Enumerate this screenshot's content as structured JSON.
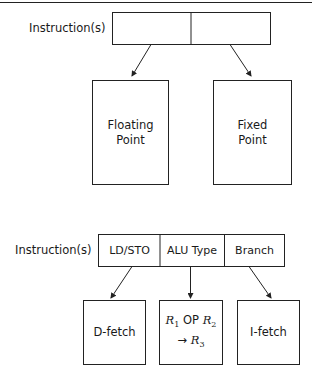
{
  "diagram": {
    "top": {
      "row_label": "Instruction(s)",
      "fields": [
        "",
        ""
      ],
      "targets": [
        {
          "line1": "Floating",
          "line2": "Point"
        },
        {
          "line1": "Fixed",
          "line2": "Point"
        }
      ]
    },
    "bottom": {
      "row_label": "Instruction(s)",
      "fields": [
        "LD/STO",
        "ALU Type",
        "Branch"
      ],
      "targets": [
        {
          "label": "D-fetch"
        },
        {
          "r1": "R",
          "r1_sub": "1",
          "op": "OP",
          "r2": "R",
          "r2_sub": "2",
          "arrow": "→",
          "r3": "R",
          "r3_sub": "3"
        },
        {
          "label": "I-fetch"
        }
      ]
    },
    "colors": {
      "stroke": "#222222",
      "background": "#ffffff",
      "text": "#1a1a1a"
    }
  }
}
